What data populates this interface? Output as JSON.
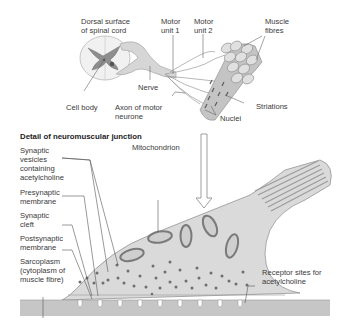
{
  "figure": {
    "upper_labels": {
      "dorsal_surface": "Dorsal surface\nof spinal cord",
      "motor_unit_1": "Motor\nunit 1",
      "motor_unit_2": "Motor\nunit 2",
      "muscle_fibres": "Muscle\nfibres",
      "nerve": "Nerve",
      "cell_body": "Cell body",
      "axon": "Axon of motor\nneurone",
      "striations": "Striations",
      "nuclei": "Nuclei"
    },
    "detail_title": "Detail of neuromuscular junction",
    "detail_labels": {
      "synaptic_vesicles": "Synaptic\nvesicles\ncontaining\nacetylcholine",
      "presynaptic_membrane": "Presynaptic\nmembrane",
      "synaptic_cleft": "Synaptic\ncleft",
      "postsynaptic_membrane": "Postsynaptic\nmembrane",
      "sarcoplasm": "Sarcoplasm\n(cytoplasm of\nmuscle fibre)",
      "mitochondrion": "Mitochondrion",
      "receptor_sites": "Receptor sites for\nacetylcholine"
    },
    "colors": {
      "tissue_fill": "#d9d9d9",
      "outline": "#8a8a8a",
      "vesicle": "#6e6e6e",
      "muscle_band": "#c8c8c8",
      "leader_line": "#555555"
    }
  }
}
